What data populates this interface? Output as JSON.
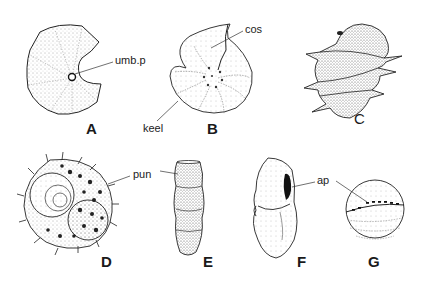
{
  "figure": {
    "panels": [
      {
        "id": "A",
        "label": "A"
      },
      {
        "id": "B",
        "label": "B"
      },
      {
        "id": "C",
        "label": "C"
      },
      {
        "id": "D",
        "label": "D"
      },
      {
        "id": "E",
        "label": "E"
      },
      {
        "id": "F",
        "label": "F"
      },
      {
        "id": "G",
        "label": "G"
      }
    ],
    "annotations": {
      "umb_p": "umb.p",
      "cos": "cos",
      "keel": "keel",
      "pun": "pun",
      "ap": "ap"
    },
    "colors": {
      "ink": "#1a1a1a",
      "stipple": "#555555",
      "background": "#ffffff"
    }
  }
}
